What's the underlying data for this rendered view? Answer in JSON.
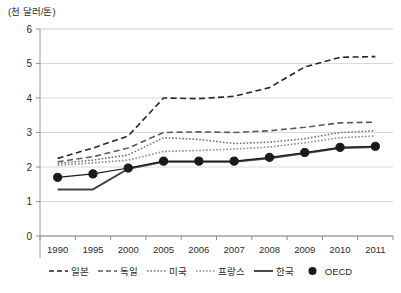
{
  "axis_unit_label": "(천 달러/톤)",
  "legend": {
    "items": [
      {
        "label": "일본",
        "style": "dashed-long",
        "color": "#262626",
        "marker": "none"
      },
      {
        "label": "독일",
        "style": "dashed-long",
        "color": "#595959",
        "marker": "none"
      },
      {
        "label": "미국",
        "style": "dotted",
        "color": "#737373",
        "marker": "none"
      },
      {
        "label": "프랑스",
        "style": "dotted",
        "color": "#8c8c8c",
        "marker": "none"
      },
      {
        "label": "한국",
        "style": "solid",
        "color": "#404040",
        "marker": "none"
      },
      {
        "label": "OECD",
        "style": "solid-thin",
        "color": "#1a1a1a",
        "marker": "circle"
      }
    ]
  },
  "chart_data": {
    "type": "line",
    "title": "",
    "xlabel": "",
    "ylabel": "(천 달러/톤)",
    "ylim": [
      0,
      6
    ],
    "yticks": [
      0,
      1,
      2,
      3,
      4,
      5,
      6
    ],
    "ytick_labels": [
      "0",
      "1",
      "2",
      "3",
      "4",
      "5",
      "6"
    ],
    "grid": true,
    "grid_axis": "y",
    "legend_position": "bottom",
    "categories": [
      "1990",
      "1995",
      "2000",
      "2005",
      "2006",
      "2007",
      "2008",
      "2009",
      "2010",
      "2011"
    ],
    "series": [
      {
        "name": "일본",
        "values": [
          2.25,
          2.55,
          2.9,
          4.0,
          3.98,
          4.05,
          4.3,
          4.9,
          5.18,
          5.2
        ]
      },
      {
        "name": "독일",
        "values": [
          2.15,
          2.3,
          2.55,
          3.0,
          3.02,
          3.0,
          3.05,
          3.15,
          3.28,
          3.3
        ]
      },
      {
        "name": "미국",
        "values": [
          2.1,
          2.2,
          2.35,
          2.85,
          2.8,
          2.68,
          2.72,
          2.82,
          3.0,
          3.05
        ]
      },
      {
        "name": "프랑스",
        "values": [
          2.05,
          2.12,
          2.2,
          2.45,
          2.48,
          2.52,
          2.58,
          2.7,
          2.85,
          2.9
        ]
      },
      {
        "name": "한국",
        "values": [
          1.35,
          1.35,
          1.95,
          2.15,
          2.15,
          2.15,
          2.25,
          2.4,
          2.55,
          2.58
        ]
      },
      {
        "name": "OECD",
        "values": [
          1.7,
          1.8,
          1.97,
          2.17,
          2.17,
          2.17,
          2.28,
          2.42,
          2.57,
          2.6
        ]
      }
    ]
  }
}
